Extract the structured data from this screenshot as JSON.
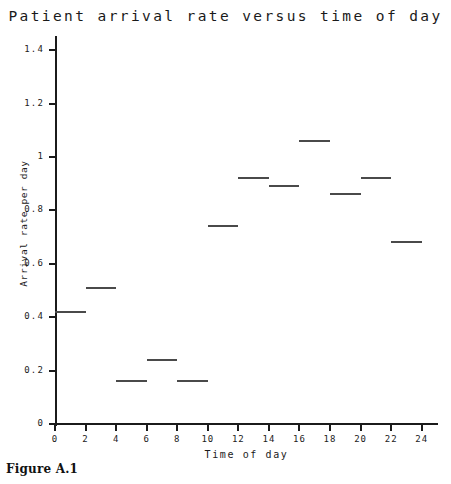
{
  "figure": {
    "caption": "Figure A.1"
  },
  "chart_data": {
    "type": "bar",
    "title": "Patient arrival rate versus time of day",
    "xlabel": "Time of day",
    "ylabel": "Arrival rate per day",
    "xlim": [
      0,
      25
    ],
    "ylim": [
      0,
      1.5
    ],
    "grid": false,
    "legend": null,
    "style": "step-segments",
    "bin_width": 2,
    "x_ticks": [
      "0",
      "2",
      "4",
      "6",
      "8",
      "10",
      "12",
      "14",
      "16",
      "18",
      "20",
      "22",
      "24"
    ],
    "x_tick_values": [
      0,
      2,
      4,
      6,
      8,
      10,
      12,
      14,
      16,
      18,
      20,
      22,
      24
    ],
    "y_ticks": [
      "0",
      "0.2",
      "0.4",
      "0.6",
      "0.8",
      "1",
      "1.2",
      "1.4"
    ],
    "y_tick_values": [
      0,
      0.2,
      0.4,
      0.6,
      0.8,
      1.0,
      1.2,
      1.4
    ],
    "bins": [
      {
        "start": 0,
        "end": 2,
        "label": "0-2",
        "value": 0.42
      },
      {
        "start": 2,
        "end": 4,
        "label": "2-4",
        "value": 0.51
      },
      {
        "start": 4,
        "end": 6,
        "label": "4-6",
        "value": 0.16
      },
      {
        "start": 6,
        "end": 8,
        "label": "6-8",
        "value": 0.24
      },
      {
        "start": 8,
        "end": 10,
        "label": "8-10",
        "value": 0.16
      },
      {
        "start": 10,
        "end": 12,
        "label": "10-12",
        "value": 0.74
      },
      {
        "start": 12,
        "end": 14,
        "label": "12-14",
        "value": 0.92
      },
      {
        "start": 14,
        "end": 16,
        "label": "14-16",
        "value": 0.89
      },
      {
        "start": 16,
        "end": 18,
        "label": "16-18",
        "value": 1.06
      },
      {
        "start": 18,
        "end": 20,
        "label": "18-20",
        "value": 0.86
      },
      {
        "start": 20,
        "end": 22,
        "label": "20-22",
        "value": 0.92
      },
      {
        "start": 22,
        "end": 24,
        "label": "22-24",
        "value": 0.68
      }
    ],
    "categories": [
      "0-2",
      "2-4",
      "4-6",
      "6-8",
      "8-10",
      "10-12",
      "12-14",
      "14-16",
      "16-18",
      "18-20",
      "20-22",
      "22-24"
    ],
    "values": [
      0.42,
      0.51,
      0.16,
      0.24,
      0.16,
      0.74,
      0.92,
      0.89,
      1.06,
      0.86,
      0.92,
      0.68
    ],
    "colors": {
      "line": "#4a4a4a",
      "axis": "#1b1b1b",
      "background": "#ffffff"
    }
  }
}
